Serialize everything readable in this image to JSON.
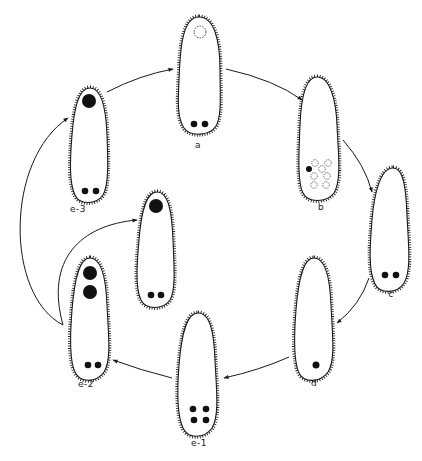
{
  "diagram": {
    "type": "life-cycle",
    "colors": {
      "ink": "#1a1a1a",
      "background": "#ffffff"
    },
    "stages": [
      {
        "id": "a",
        "label": "a",
        "cx": 199,
        "top": 15,
        "bottom": 136,
        "w": 42,
        "features": "dashed-circle-top, two-small-dots-bottom"
      },
      {
        "id": "b",
        "label": "b",
        "cx": 319,
        "top": 76,
        "bottom": 200,
        "w": 42,
        "features": "one-dot, six-dashed-circles"
      },
      {
        "id": "c",
        "label": "c",
        "cx": 389,
        "top": 166,
        "bottom": 294,
        "w": 42,
        "features": "two-small-dots-bottom"
      },
      {
        "id": "d",
        "label": "d",
        "cx": 314,
        "top": 256,
        "bottom": 383,
        "w": 42,
        "features": "one-dot-bottom"
      },
      {
        "id": "e-1",
        "label": "e-1",
        "cx": 199,
        "top": 311,
        "bottom": 440,
        "w": 42,
        "features": "four-dots-bottom"
      },
      {
        "id": "e-2",
        "label": "e-2",
        "cx": 91,
        "top": 256,
        "bottom": 383,
        "w": 42,
        "features": "two-large-dots-top, two-small-dots-bottom"
      },
      {
        "id": "e-2b",
        "label": "",
        "cx": 156,
        "top": 190,
        "bottom": 310,
        "w": 42,
        "features": "one-large-dot-top, two-small-dots-bottom"
      },
      {
        "id": "e-3",
        "label": "e-3",
        "cx": 91,
        "top": 86,
        "bottom": 206,
        "w": 42,
        "features": "one-large-dot-top, two-small-dots-bottom"
      }
    ],
    "labels": {
      "a": "a",
      "b": "b",
      "c": "c",
      "d": "d",
      "e1": "e-1",
      "e2": "e-2",
      "e3": "e-3"
    },
    "arrows": [
      {
        "from": "e-3",
        "to": "a"
      },
      {
        "from": "a",
        "to": "b"
      },
      {
        "from": "b",
        "to": "c"
      },
      {
        "from": "c",
        "to": "d"
      },
      {
        "from": "d",
        "to": "e-1"
      },
      {
        "from": "e-1",
        "to": "e-2"
      },
      {
        "from": "e-2",
        "to": "e-3"
      },
      {
        "from": "e-2",
        "to": "e-2b"
      }
    ]
  }
}
